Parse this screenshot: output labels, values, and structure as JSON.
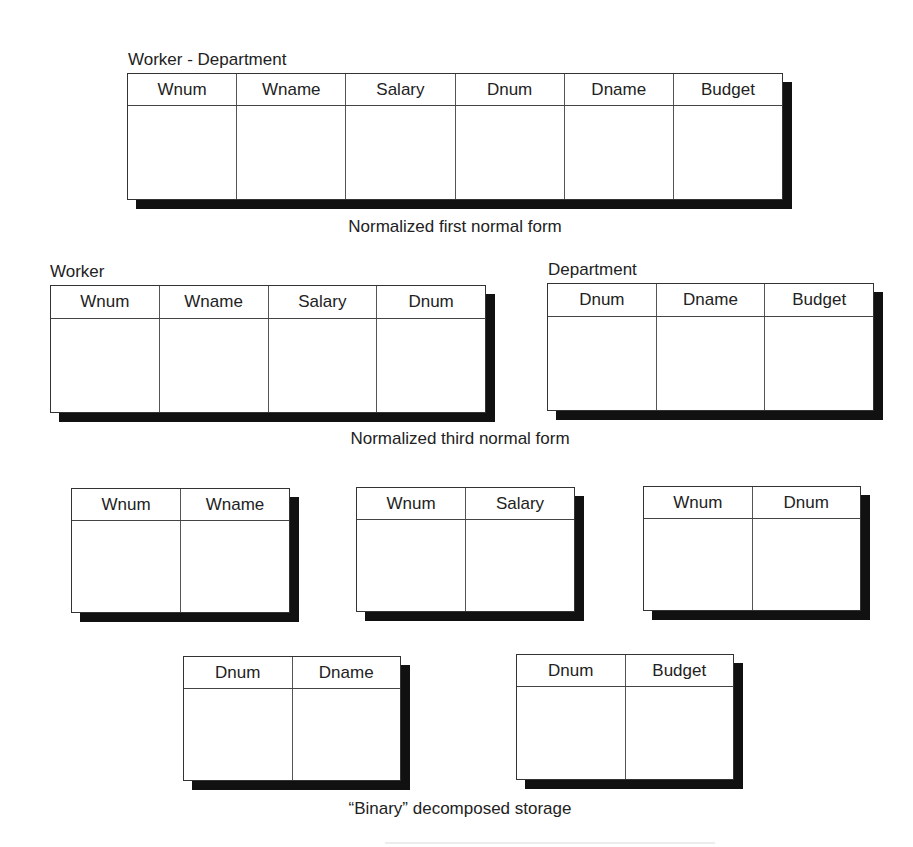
{
  "sections": {
    "first_normal_form": {
      "caption": "Normalized first normal form",
      "tables": [
        {
          "title": "Worker - Department",
          "columns": [
            "Wnum",
            "Wname",
            "Salary",
            "Dnum",
            "Dname",
            "Budget"
          ]
        }
      ]
    },
    "third_normal_form": {
      "caption": "Normalized third normal form",
      "tables": [
        {
          "title": "Worker",
          "columns": [
            "Wnum",
            "Wname",
            "Salary",
            "Dnum"
          ]
        },
        {
          "title": "Department",
          "columns": [
            "Dnum",
            "Dname",
            "Budget"
          ]
        }
      ]
    },
    "binary_decomposed": {
      "caption": "“Binary” decomposed storage",
      "tables": [
        {
          "columns": [
            "Wnum",
            "Wname"
          ]
        },
        {
          "columns": [
            "Wnum",
            "Salary"
          ]
        },
        {
          "columns": [
            "Wnum",
            "Dnum"
          ]
        },
        {
          "columns": [
            "Dnum",
            "Dname"
          ]
        },
        {
          "columns": [
            "Dnum",
            "Budget"
          ]
        }
      ]
    }
  },
  "colors": {
    "background": "#ffffff",
    "border": "#333333",
    "shadow": "#111111",
    "text": "#222222"
  }
}
